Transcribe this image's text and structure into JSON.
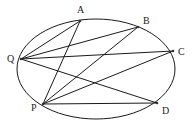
{
  "diagram": {
    "type": "ellipse-with-chords",
    "ellipse": {
      "cx": 96,
      "cy": 69,
      "rx": 79,
      "ry": 50
    },
    "points": [
      {
        "id": "A",
        "x": 80,
        "y": 21,
        "label_x": 77,
        "label_y": 13
      },
      {
        "id": "B",
        "x": 138,
        "y": 27,
        "label_x": 143,
        "label_y": 24
      },
      {
        "id": "C",
        "x": 173,
        "y": 51,
        "label_x": 178,
        "label_y": 55
      },
      {
        "id": "D",
        "x": 157,
        "y": 103,
        "label_x": 162,
        "label_y": 114
      },
      {
        "id": "P",
        "x": 43,
        "y": 104,
        "label_x": 31,
        "label_y": 111
      },
      {
        "id": "Q",
        "x": 21,
        "y": 59,
        "label_x": 7,
        "label_y": 62
      }
    ],
    "segments": [
      [
        "Q",
        "A"
      ],
      [
        "Q",
        "B"
      ],
      [
        "Q",
        "C"
      ],
      [
        "Q",
        "D"
      ],
      [
        "P",
        "A"
      ],
      [
        "P",
        "B"
      ],
      [
        "P",
        "C"
      ],
      [
        "P",
        "D"
      ]
    ],
    "labels": {
      "A": "A",
      "B": "B",
      "C": "C",
      "D": "D",
      "P": "P",
      "Q": "Q"
    }
  }
}
